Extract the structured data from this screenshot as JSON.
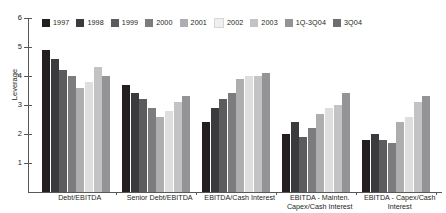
{
  "chart_data": {
    "type": "bar",
    "title": "",
    "subtitle": "",
    "xlabel": "",
    "ylabel": "Leverage",
    "ylim": [
      0,
      6
    ],
    "yticks": [
      1,
      2,
      3,
      4,
      5,
      6
    ],
    "ytick_labels": [
      "1",
      "2",
      "3",
      "4",
      "5",
      "6"
    ],
    "grid": false,
    "legend_position": "top",
    "categories": [
      "Debt/EBITDA",
      "Senior Debt/EBITDA",
      "EBITDA/Cash Interest",
      "EBITDA - Mainten. Capex/Cash Interest",
      "EBITDA - Capex/Cash Interest"
    ],
    "category_label_lines": [
      [
        "Debt/EBITDA"
      ],
      [
        "Senior Debt/EBITDA"
      ],
      [
        "EBITDA/Cash Interest"
      ],
      [
        "EBITDA - Mainten.",
        "Capex/Cash Interest"
      ],
      [
        "EBITDA - Capex/Cash",
        "Interest"
      ]
    ],
    "series": [
      {
        "name": "1997",
        "color": "#231f20",
        "values": [
          4.9,
          3.7,
          2.4,
          2.0,
          1.8
        ]
      },
      {
        "name": "1998",
        "color": "#3b3a3c",
        "values": [
          4.6,
          3.4,
          2.9,
          2.4,
          2.0
        ]
      },
      {
        "name": "1999",
        "color": "#5c5b5e",
        "values": [
          4.2,
          3.2,
          3.2,
          1.9,
          1.8
        ]
      },
      {
        "name": "2000",
        "color": "#7c7b7e",
        "values": [
          4.0,
          2.9,
          3.4,
          2.2,
          1.7
        ]
      },
      {
        "name": "2001",
        "color": "#aeadb0",
        "values": [
          3.6,
          2.6,
          3.9,
          2.7,
          2.4
        ]
      },
      {
        "name": "2002",
        "color": "#dedede",
        "values": [
          3.8,
          2.8,
          4.0,
          2.9,
          2.6
        ]
      },
      {
        "name": "2003",
        "color": "#c3c2c4",
        "values": [
          4.3,
          3.1,
          4.0,
          3.0,
          3.1
        ]
      },
      {
        "name": "1Q-3Q04",
        "color": "#949396",
        "values": [
          4.0,
          3.3,
          4.1,
          3.4,
          3.3
        ]
      },
      {
        "name": "3Q04",
        "color": "#6e6d70",
        "values": [
          0.0,
          0.0,
          0.0,
          0.0,
          0.0
        ]
      }
    ]
  },
  "legend": {
    "items": [
      {
        "label": "1997",
        "color": "#231f20"
      },
      {
        "label": "1998",
        "color": "#3b3a3c"
      },
      {
        "label": "1999",
        "color": "#5c5b5e"
      },
      {
        "label": "2000",
        "color": "#7c7b7e"
      },
      {
        "label": "2001",
        "color": "#aeadb0"
      },
      {
        "label": "2002",
        "color": "#efefef"
      },
      {
        "label": "2003",
        "color": "#c3c2c4"
      },
      {
        "label": "1Q-3Q04",
        "color": "#949396"
      },
      {
        "label": "3Q04",
        "color": "#6e6d70"
      }
    ]
  },
  "axis": {
    "y_title": "Leverage",
    "y_tick_labels": [
      "6",
      "5",
      "4",
      "3",
      "2",
      "1"
    ],
    "axis_color": "#58585b"
  }
}
